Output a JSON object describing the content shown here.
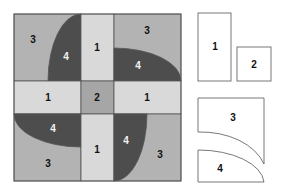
{
  "colors": {
    "piece1": "#d9d9d9",
    "piece2": "#a6a6a6",
    "piece3": "#b3b3b3",
    "piece4": "#4d4d4d",
    "outline": "#555555",
    "template_fill": "#ffffff",
    "label_dark": "#111111",
    "label_light": "#f2f2f2"
  },
  "block": {
    "labels": {
      "tl_3": "3",
      "tl_4": "4",
      "top_1": "1",
      "tr_3": "3",
      "tr_4": "4",
      "left_1": "1",
      "center_2": "2",
      "right_1": "1",
      "bl_4": "4",
      "bl_3": "3",
      "bottom_1": "1",
      "br_4": "4",
      "br_3": "3"
    }
  },
  "templates": {
    "rect1": "1",
    "square2": "2",
    "piece3": "3",
    "piece4": "4"
  }
}
